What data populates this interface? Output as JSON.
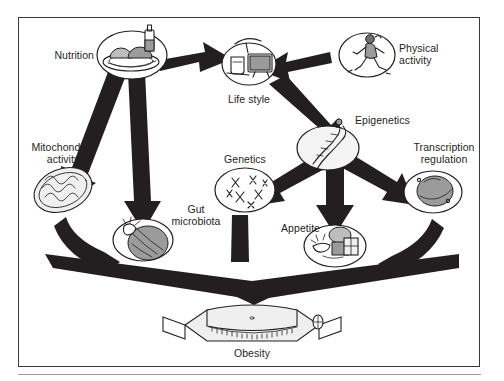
{
  "figure": {
    "background": "#ffffff",
    "frame_color": "#3a3a3a",
    "arrow_color": "#231f20",
    "text_color": "#231f20"
  },
  "nodes": [
    {
      "id": "nutrition",
      "label": "Nutrition",
      "icon": "plate-of-food-icon",
      "label_pos": "left"
    },
    {
      "id": "lifestyle",
      "label": "Life style",
      "icon": "television-icon",
      "label_pos": "below"
    },
    {
      "id": "physical",
      "label": "Physical\nactivity",
      "icon": "running-person-icon",
      "label_pos": "right"
    },
    {
      "id": "epigenetics",
      "label": "Epigenetics",
      "icon": "dna-helix-icon",
      "label_pos": "right"
    },
    {
      "id": "mitochondria",
      "label": "Mitochondrial\nactivity",
      "icon": "mitochondrion-icon",
      "label_pos": "above"
    },
    {
      "id": "genetics",
      "label": "Genetics",
      "icon": "chromosomes-icon",
      "label_pos": "above"
    },
    {
      "id": "transcription",
      "label": "Transcription\nregulation",
      "icon": "cell-nucleus-icon",
      "label_pos": "above"
    },
    {
      "id": "gut",
      "label": "Gut\nmicrobiota",
      "icon": "intestine-icon",
      "label_pos": "right"
    },
    {
      "id": "appetite",
      "label": "Appetite",
      "icon": "hand-with-food-icon",
      "label_pos": "left"
    },
    {
      "id": "obesity",
      "label": "Obesity",
      "icon": "bathroom-scale-icon",
      "label_pos": "below"
    }
  ],
  "edges": [
    {
      "from": "nutrition",
      "to": "lifestyle"
    },
    {
      "from": "physical",
      "to": "lifestyle"
    },
    {
      "from": "nutrition",
      "to": "mitochondria"
    },
    {
      "from": "nutrition",
      "to": "gut"
    },
    {
      "from": "lifestyle",
      "to": "epigenetics"
    },
    {
      "from": "epigenetics",
      "to": "genetics"
    },
    {
      "from": "epigenetics",
      "to": "appetite"
    },
    {
      "from": "epigenetics",
      "to": "transcription"
    },
    {
      "from": "mitochondria",
      "to": "obesity"
    },
    {
      "from": "genetics",
      "to": "obesity"
    },
    {
      "from": "transcription",
      "to": "obesity"
    }
  ],
  "labels": {
    "nutrition": "Nutrition",
    "lifestyle": "Life style",
    "physical": "Physical\nactivity",
    "epigenetics": "Epigenetics",
    "mitochondria": "Mitochondrial\nactivity",
    "genetics": "Genetics",
    "transcription": "Transcription\nregulation",
    "gut": "Gut\nmicrobiota",
    "appetite": "Appetite",
    "obesity": "Obesity"
  }
}
